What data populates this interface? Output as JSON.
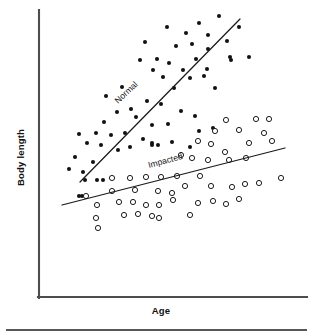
{
  "figure": {
    "background_color": "#ffffff",
    "axis_color": "#4d4d4d",
    "rule_color": "#55585a",
    "marker_color": "#111111"
  },
  "labels": {
    "y_axis_title": "Body length",
    "x_axis_title": "Age",
    "series_normal": "Normal",
    "series_impacted": "Impacted"
  },
  "chart_data": {
    "type": "scatter",
    "title": "",
    "xlabel": "Age",
    "ylabel": "Body length",
    "xlim": [
      0,
      100
    ],
    "ylim": [
      0,
      100
    ],
    "grid": false,
    "legend_position": "inline-annotation",
    "axes_style": "left-and-bottom-spines-only",
    "tick_labels": {
      "x": [],
      "y": []
    },
    "annotations": [
      {
        "text": "Normal",
        "x": 30,
        "y": 72,
        "rotation_deg": -42
      },
      {
        "text": "Impacted",
        "x": 52,
        "y": 47,
        "rotation_deg": -14
      }
    ],
    "series": [
      {
        "name": "Normal",
        "marker": "filled-circle",
        "marker_color": "#111111",
        "marker_size_px": 4.1,
        "trend_line": {
          "x_start": 80,
          "y_start": 182,
          "x_end": 240,
          "y_end": 19,
          "slope_描述": "steep positive"
        },
        "points_px": [
          [
            199,
            23
          ],
          [
            219,
            16
          ],
          [
            239,
            27
          ],
          [
            186,
            33
          ],
          [
            208,
            35
          ],
          [
            167,
            27
          ],
          [
            176,
            46
          ],
          [
            192,
            44
          ],
          [
            196,
            59
          ],
          [
            208,
            49
          ],
          [
            227,
            41
          ],
          [
            231,
            60
          ],
          [
            145,
            42
          ],
          [
            157,
            59
          ],
          [
            169,
            63
          ],
          [
            183,
            70
          ],
          [
            207,
            69
          ],
          [
            230,
            57
          ],
          [
            249,
            57
          ],
          [
            140,
            60
          ],
          [
            153,
            70
          ],
          [
            163,
            77
          ],
          [
            174,
            88
          ],
          [
            190,
            78
          ],
          [
            204,
            76
          ],
          [
            215,
            88
          ],
          [
            106,
            96
          ],
          [
            122,
            87
          ],
          [
            131,
            109
          ],
          [
            147,
            101
          ],
          [
            161,
            104
          ],
          [
            117,
            112
          ],
          [
            136,
            117
          ],
          [
            152,
            125
          ],
          [
            168,
            124
          ],
          [
            181,
            111
          ],
          [
            195,
            116
          ],
          [
            199,
            131
          ],
          [
            213,
            128
          ],
          [
            104,
            122
          ],
          [
            96,
            133
          ],
          [
            111,
            135
          ],
          [
            125,
            133
          ],
          [
            143,
            139
          ],
          [
            158,
            145
          ],
          [
            172,
            142
          ],
          [
            79,
            134
          ],
          [
            87,
            143
          ],
          [
            101,
            145
          ],
          [
            118,
            150
          ],
          [
            130,
            147
          ],
          [
            152,
            143
          ],
          [
            152,
            145
          ],
          [
            190,
            147
          ],
          [
            75,
            157
          ],
          [
            93,
            162
          ],
          [
            69,
            169
          ],
          [
            83,
            172
          ],
          [
            85,
            180
          ],
          [
            97,
            180
          ],
          [
            103,
            180
          ],
          [
            79,
            196
          ],
          [
            82,
            196
          ]
        ]
      },
      {
        "name": "Impacted",
        "marker": "open-circle",
        "marker_color": "#111111",
        "marker_size_px": 5.2,
        "trend_line": {
          "x_start": 62,
          "y_start": 205,
          "x_end": 285,
          "y_end": 148,
          "slope_描述": "shallow positive"
        },
        "points_px": [
          [
            226,
            120
          ],
          [
            256,
            119
          ],
          [
            269,
            119
          ],
          [
            215,
            131
          ],
          [
            239,
            130
          ],
          [
            264,
            133
          ],
          [
            198,
            141
          ],
          [
            211,
            144
          ],
          [
            225,
            152
          ],
          [
            249,
            143
          ],
          [
            272,
            141
          ],
          [
            181,
            155
          ],
          [
            192,
            158
          ],
          [
            208,
            160
          ],
          [
            229,
            160
          ],
          [
            246,
            158
          ],
          [
            112,
            178
          ],
          [
            130,
            178
          ],
          [
            146,
            177
          ],
          [
            161,
            177
          ],
          [
            177,
            176
          ],
          [
            200,
            176
          ],
          [
            112,
            191
          ],
          [
            86,
            196
          ],
          [
            135,
            190
          ],
          [
            158,
            191
          ],
          [
            172,
            193
          ],
          [
            185,
            186
          ],
          [
            211,
            186
          ],
          [
            232,
            187
          ],
          [
            245,
            184
          ],
          [
            259,
            183
          ],
          [
            281,
            178
          ],
          [
            97,
            205
          ],
          [
            119,
            202
          ],
          [
            133,
            202
          ],
          [
            146,
            205
          ],
          [
            159,
            205
          ],
          [
            173,
            200
          ],
          [
            198,
            203
          ],
          [
            213,
            201
          ],
          [
            226,
            204
          ],
          [
            239,
            199
          ],
          [
            96,
            218
          ],
          [
            124,
            215
          ],
          [
            138,
            214
          ],
          [
            152,
            216
          ],
          [
            159,
            218
          ],
          [
            190,
            215
          ],
          [
            98,
            228
          ]
        ]
      }
    ]
  }
}
